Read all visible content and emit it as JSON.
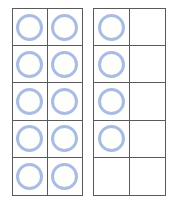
{
  "figure": {
    "counter_color": "#a9bde3",
    "grid_line_color": "#5a5a5a",
    "background_color": "#ffffff",
    "frames": [
      {
        "name": "left-ten-frame",
        "rows": 5,
        "cols": 2,
        "filled": [
          [
            1,
            1
          ],
          [
            1,
            1
          ],
          [
            1,
            1
          ],
          [
            1,
            1
          ],
          [
            1,
            1
          ]
        ],
        "counter_count": 10
      },
      {
        "name": "right-ten-frame",
        "rows": 5,
        "cols": 2,
        "filled": [
          [
            1,
            0
          ],
          [
            1,
            0
          ],
          [
            1,
            0
          ],
          [
            1,
            0
          ],
          [
            0,
            0
          ]
        ],
        "counter_count": 4
      }
    ],
    "total_counters": 14
  }
}
